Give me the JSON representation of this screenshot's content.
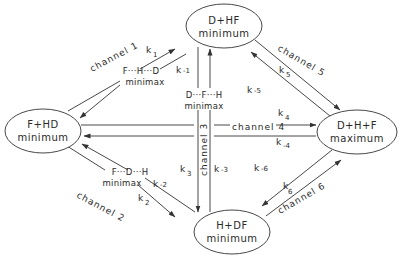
{
  "diagram": {
    "type": "reaction-channel network",
    "nodes": [
      {
        "id": "top",
        "line1": "D+HF",
        "line2": "minimum"
      },
      {
        "id": "left",
        "line1": "F+HD",
        "line2": "minimum"
      },
      {
        "id": "right",
        "line1": "D+H+F",
        "line2": "maximum"
      },
      {
        "id": "bottom",
        "line1": "H+DF",
        "line2": "minimum"
      }
    ],
    "transition_states": [
      {
        "id": "ts1",
        "line1": "F···H···D",
        "line2": "minimax"
      },
      {
        "id": "ts2",
        "line1": "F···D···H",
        "line2": "minimax"
      },
      {
        "id": "ts3",
        "line1": "D···F···H",
        "line2": "minimax"
      }
    ],
    "channels": [
      {
        "label": "channel 1",
        "k_fwd": "k",
        "k_fwd_sub": "1",
        "k_rev": "k",
        "k_rev_sub": "-1"
      },
      {
        "label": "channel 2",
        "k_fwd": "k",
        "k_fwd_sub": "2",
        "k_rev": "k",
        "k_rev_sub": "-2"
      },
      {
        "label": "channel 3",
        "k_fwd": "k",
        "k_fwd_sub": "3",
        "k_rev": "k",
        "k_rev_sub": "-3"
      },
      {
        "label": "channel 4",
        "k_fwd": "k",
        "k_fwd_sub": "4",
        "k_rev": "k",
        "k_rev_sub": "-4"
      },
      {
        "label": "channel 5",
        "k_fwd": "k",
        "k_fwd_sub": "5",
        "k_rev": "k",
        "k_rev_sub": "-5"
      },
      {
        "label": "channel 6",
        "k_fwd": "k",
        "k_fwd_sub": "6",
        "k_rev": "k",
        "k_rev_sub": "-6"
      }
    ]
  }
}
